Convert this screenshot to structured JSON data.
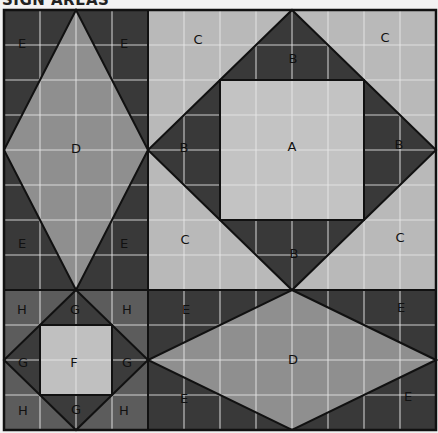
{
  "header": {
    "title": "SIGN AREAS"
  },
  "colors": {
    "dark": "#393939",
    "medium_dark": "#5c5c5c",
    "medium": "#8f8f8f",
    "light": "#b9b9b9",
    "lighter": "#c3c3c3",
    "grid": "#e8e8e8",
    "seam": "#111111"
  },
  "blocks": {
    "top_left": {
      "center_label": "D",
      "corner_labels": [
        "E",
        "E",
        "E",
        "E"
      ]
    },
    "top_right": {
      "center_label": "A",
      "triangle_labels": [
        "B",
        "B",
        "B",
        "B"
      ],
      "corner_labels": [
        "C",
        "C",
        "C",
        "C"
      ]
    },
    "bottom_left": {
      "center_label": "F",
      "triangle_labels": [
        "G",
        "G",
        "G",
        "G"
      ],
      "corner_labels": [
        "H",
        "H",
        "H",
        "H"
      ]
    },
    "bottom_right": {
      "center_label": "D",
      "corner_labels": [
        "E",
        "E",
        "E",
        "E"
      ]
    }
  }
}
